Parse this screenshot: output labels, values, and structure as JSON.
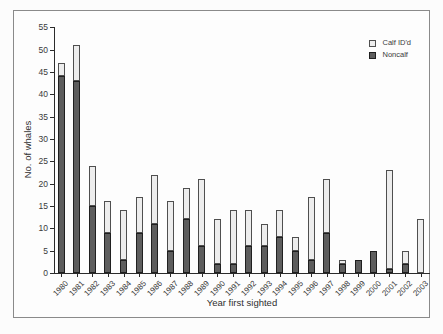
{
  "chart_data": {
    "type": "bar",
    "stacked": true,
    "title": "",
    "xlabel": "Year first sighted",
    "ylabel": "No. of whales",
    "ylim": [
      0,
      55
    ],
    "ytick_step": 5,
    "grid": false,
    "legend_position": "top-right",
    "categories": [
      "1980",
      "1981",
      "1982",
      "1983",
      "1984",
      "1985",
      "1986",
      "1987",
      "1988",
      "1989",
      "1990",
      "1991",
      "1992",
      "1993",
      "1994",
      "1995",
      "1996",
      "1997",
      "1998",
      "1999",
      "2000",
      "2001",
      "2002",
      "2003"
    ],
    "series": [
      {
        "name": "Noncalf",
        "color": "#5d5d5d",
        "border": "#1f1f1f",
        "values": [
          44,
          43,
          15,
          9,
          3,
          9,
          11,
          5,
          12,
          6,
          2,
          2,
          6,
          6,
          8,
          5,
          3,
          9,
          2,
          3,
          5,
          1,
          2,
          0
        ]
      },
      {
        "name": "Calf ID'd",
        "color": "#ededed",
        "border": "#4f4f4f",
        "values": [
          3,
          8,
          9,
          7,
          11,
          8,
          11,
          11,
          7,
          15,
          10,
          12,
          8,
          5,
          6,
          3,
          14,
          12,
          1,
          0,
          0,
          22,
          3,
          12
        ]
      }
    ],
    "totals": [
      47,
      51,
      24,
      16,
      14,
      17,
      22,
      16,
      19,
      21,
      12,
      14,
      14,
      11,
      14,
      8,
      17,
      21,
      3,
      3,
      5,
      23,
      5,
      12
    ],
    "legend": {
      "items": [
        {
          "label": "Calf ID'd",
          "swatch": "light"
        },
        {
          "label": "Noncalf",
          "swatch": "dark"
        }
      ]
    }
  }
}
